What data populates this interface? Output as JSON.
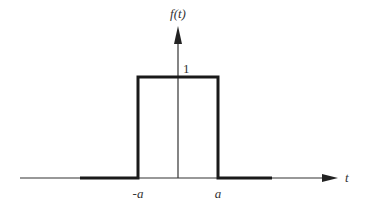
{
  "diagram": {
    "y_axis_label": "f(t)",
    "x_axis_label": "t",
    "amplitude_label": "1",
    "left_edge_label": "-a",
    "right_edge_label": "a",
    "colors": {
      "line": "#1a1a1a",
      "axis": "#333333",
      "text": "#333333"
    }
  }
}
